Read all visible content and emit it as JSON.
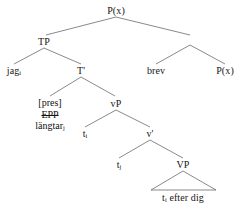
{
  "diagram": {
    "type": "syntax-tree",
    "title": "",
    "sentence": "jag längtar efter dig brev",
    "nodes": {
      "root": "P(x)",
      "tp": "TP",
      "subject": "jag",
      "subject_sub": "i",
      "tbar": "T'",
      "t_head_tense": "[pres]",
      "t_head_epp": "EPP",
      "t_head_verb": "längtar",
      "t_head_verb_sub": "j",
      "spec_vp_trace": "t",
      "spec_vp_trace_sub": "i",
      "vp": "vP",
      "vbar": "v'",
      "v_trace": "t",
      "v_trace_sub": "j",
      "big_vp": "VP",
      "vp_content": "efter dig",
      "vp_content_trace": "t",
      "vp_content_trace_sub": "i",
      "right_object": "brev",
      "right_px": "P(x)"
    },
    "annotations": {
      "epp_struck_through": "EPP",
      "triangle_label": "t efter dig"
    },
    "colors": {
      "ink": "#151515",
      "line": "#6b6b6b",
      "background": "#ffffff"
    }
  }
}
